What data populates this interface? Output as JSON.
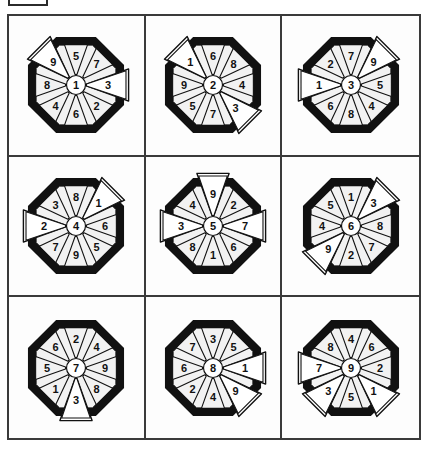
{
  "page": {
    "background_color": "#ffffff",
    "line_color": "#3a3a3a",
    "ink_color": "#111111",
    "ring_color": "#111111",
    "petal_fill": "#f2f2f2"
  },
  "corner_marker": {
    "name": "corner-marker-box",
    "label": ""
  },
  "grid": {
    "rows": 3,
    "columns": 3
  },
  "diagrams": [
    {
      "id": "wheel-1",
      "row": 1,
      "col": 1,
      "center": "1",
      "petals": {
        "n": "5",
        "ne": "7",
        "e": "3",
        "se": "2",
        "s": "6",
        "sw": "4",
        "w": "8",
        "nw": "9"
      },
      "protruding": [
        "nw",
        "e"
      ]
    },
    {
      "id": "wheel-2",
      "row": 1,
      "col": 2,
      "center": "2",
      "petals": {
        "n": "6",
        "ne": "8",
        "e": "4",
        "se": "3",
        "s": "7",
        "sw": "5",
        "w": "9",
        "nw": "1"
      },
      "protruding": [
        "nw",
        "se"
      ]
    },
    {
      "id": "wheel-3",
      "row": 1,
      "col": 3,
      "center": "3",
      "petals": {
        "n": "7",
        "ne": "9",
        "e": "5",
        "se": "4",
        "s": "8",
        "sw": "6",
        "w": "1",
        "nw": "2"
      },
      "protruding": [
        "ne",
        "w"
      ]
    },
    {
      "id": "wheel-4",
      "row": 2,
      "col": 1,
      "center": "4",
      "petals": {
        "n": "8",
        "ne": "1",
        "e": "6",
        "se": "5",
        "s": "9",
        "sw": "7",
        "w": "2",
        "nw": "3"
      },
      "protruding": [
        "ne",
        "w"
      ]
    },
    {
      "id": "wheel-5",
      "row": 2,
      "col": 2,
      "center": "5",
      "petals": {
        "n": "9",
        "ne": "2",
        "e": "7",
        "se": "6",
        "s": "1",
        "sw": "8",
        "w": "3",
        "nw": "4"
      },
      "protruding": [
        "n",
        "w",
        "e"
      ]
    },
    {
      "id": "wheel-6",
      "row": 2,
      "col": 3,
      "center": "6",
      "petals": {
        "n": "1",
        "ne": "3",
        "e": "8",
        "se": "7",
        "s": "2",
        "sw": "9",
        "w": "4",
        "nw": "5"
      },
      "protruding": [
        "ne",
        "sw"
      ]
    },
    {
      "id": "wheel-7",
      "row": 3,
      "col": 1,
      "center": "7",
      "petals": {
        "n": "2",
        "ne": "4",
        "e": "9",
        "se": "8",
        "s": "3",
        "sw": "1",
        "w": "5",
        "nw": "6"
      },
      "protruding": [
        "s"
      ]
    },
    {
      "id": "wheel-8",
      "row": 3,
      "col": 2,
      "center": "8",
      "petals": {
        "n": "3",
        "ne": "5",
        "e": "1",
        "se": "9",
        "s": "4",
        "sw": "2",
        "w": "6",
        "nw": "7"
      },
      "protruding": [
        "e",
        "se"
      ]
    },
    {
      "id": "wheel-9",
      "row": 3,
      "col": 3,
      "center": "9",
      "petals": {
        "n": "4",
        "ne": "6",
        "e": "2",
        "se": "1",
        "s": "5",
        "sw": "3",
        "w": "7",
        "nw": "8"
      },
      "protruding": [
        "sw",
        "se",
        "w"
      ]
    }
  ]
}
